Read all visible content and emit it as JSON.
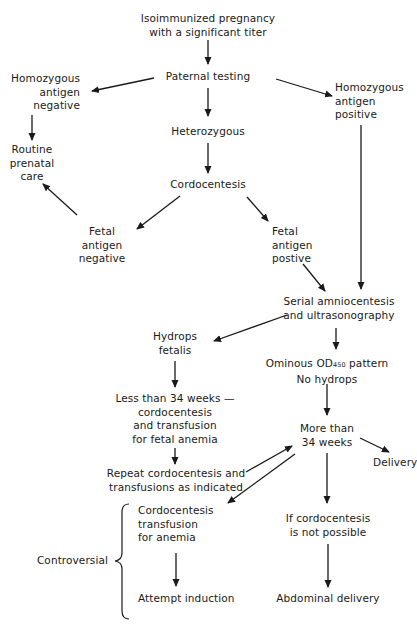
{
  "diagram": {
    "type": "flowchart",
    "nodes": {
      "start": "Isoimmunized pregnancy\nwith a significant titer",
      "paternal_testing": "Paternal testing",
      "homo_negative": "Homozygous\nantigen\nnegative",
      "homo_positive": "Homozygous\nantigen\npositive",
      "heterozygous": "Heterozygous",
      "routine_care": "Routine\nprenatal\ncare",
      "cordocentesis": "Cordocentesis",
      "fetal_negative": "Fetal\nantigen\nnegative",
      "fetal_positive": "Fetal\nantigen\npostive",
      "serial": "Serial amniocentesis\nand ultrasonography",
      "hydrops": "Hydrops\nfetalis",
      "ominous_line1_pre": "Ominous OD",
      "ominous_sub": "450",
      "ominous_line1_post": " pattern",
      "ominous_line2": "No hydrops",
      "less_than_34": "Less than 34 weeks —\ncordocentesis\nand transfusion\nfor fetal anemia",
      "more_than_34": "More than\n34 weeks",
      "delivery": "Delivery",
      "repeat": "Repeat cordocentesis and\ntransfusions as indicated",
      "cordo_transfusion": "Cordocentesis\ntransfusion\nfor anemia",
      "if_not_possible": "If cordocentesis\nis not possible",
      "attempt_induction": "Attempt induction",
      "abdominal_delivery": "Abdominal delivery",
      "controversial": "Controversial"
    },
    "edges": [
      [
        "start",
        "paternal_testing"
      ],
      [
        "paternal_testing",
        "homo_negative"
      ],
      [
        "paternal_testing",
        "heterozygous"
      ],
      [
        "paternal_testing",
        "homo_positive"
      ],
      [
        "homo_negative",
        "routine_care"
      ],
      [
        "heterozygous",
        "cordocentesis"
      ],
      [
        "cordocentesis",
        "fetal_negative"
      ],
      [
        "cordocentesis",
        "fetal_positive"
      ],
      [
        "fetal_negative",
        "routine_care"
      ],
      [
        "fetal_positive",
        "serial"
      ],
      [
        "homo_positive",
        "serial"
      ],
      [
        "serial",
        "hydrops"
      ],
      [
        "serial",
        "ominous"
      ],
      [
        "hydrops",
        "less_than_34"
      ],
      [
        "less_than_34",
        "repeat"
      ],
      [
        "ominous",
        "more_than_34"
      ],
      [
        "repeat",
        "more_than_34"
      ],
      [
        "more_than_34",
        "delivery"
      ],
      [
        "more_than_34",
        "cordo_transfusion"
      ],
      [
        "more_than_34",
        "if_not_possible"
      ],
      [
        "cordo_transfusion",
        "attempt_induction"
      ],
      [
        "if_not_possible",
        "abdominal_delivery"
      ]
    ],
    "brace_label": "Controversial",
    "colors": {
      "ink": "#1a1a1a",
      "background": "#ffffff"
    }
  }
}
